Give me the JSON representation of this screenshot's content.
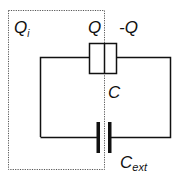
{
  "diagram": {
    "type": "circuit",
    "labels": {
      "inner_charge": "Q",
      "inner_charge_sub": "i",
      "plate_left_charge": "Q",
      "plate_right_charge": "-Q",
      "capacitor": "C",
      "external_capacitor": "C",
      "external_capacitor_sub": "ext"
    },
    "colors": {
      "wire": "#111111",
      "dotted_region": "#555555",
      "background": "#ffffff"
    },
    "components": [
      {
        "id": "capacitor-C",
        "kind": "capacitor-box",
        "label": "C"
      },
      {
        "id": "capacitor-Cext",
        "kind": "parallel-plate-capacitor",
        "label": "Cext"
      },
      {
        "id": "region-Qi",
        "kind": "dotted-boundary",
        "label": "Qi"
      }
    ]
  }
}
